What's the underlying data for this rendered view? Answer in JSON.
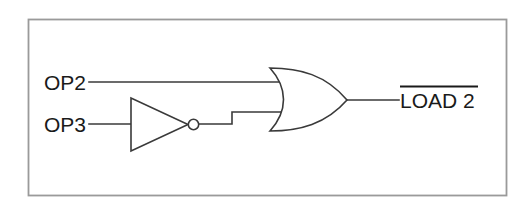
{
  "diagram": {
    "background_color": "#ffffff",
    "line_color": "#3a3a3a",
    "frame_color": "#9a9a9a",
    "text_color": "#1a1a1a"
  },
  "inputs": [
    {
      "label": "OP2",
      "to": "or-gate-input-top"
    },
    {
      "label": "OP3",
      "to": "inverter-input"
    }
  ],
  "gates": [
    {
      "type": "inverter",
      "name": "inverter",
      "symbol": "NOT",
      "has_bubble": true
    },
    {
      "type": "or",
      "name": "or-gate",
      "symbol": "OR",
      "inputs": 2
    }
  ],
  "output": {
    "label": "LOAD 2",
    "active_low": true,
    "overbar": true
  }
}
